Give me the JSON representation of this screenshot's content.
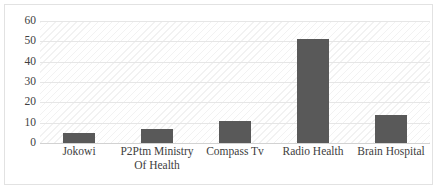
{
  "chart_data": {
    "type": "bar",
    "title": "",
    "subtitle": "",
    "xlabel": "",
    "ylabel": "",
    "categories": [
      "Jokowi",
      "P2Ptm Ministry Of Health",
      "Compass Tv",
      "Radio Health",
      "Brain Hospital"
    ],
    "values": [
      5,
      7,
      11,
      51,
      14
    ],
    "ylim": [
      0,
      60
    ],
    "yticks": [
      0,
      10,
      20,
      30,
      40,
      50,
      60
    ],
    "ytick_labels": [
      "0",
      "10",
      "20",
      "30",
      "40",
      "50",
      "60"
    ],
    "grid": "horizontal",
    "legend": "none",
    "bar_color": "#595959",
    "plot_background": "#ffffff",
    "gridline_color": "#e6e6e6",
    "border_color": "#e2e2e2"
  }
}
